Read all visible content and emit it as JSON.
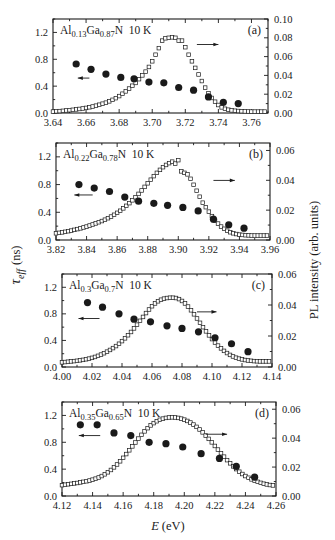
{
  "figure": {
    "y_left_label_main": "τ",
    "y_left_label_sub": "eff",
    "y_left_label_unit": "(ns)",
    "y_right_label": "PL intensity (arb. units)",
    "x_label_var": "E",
    "x_label_unit": "(eV)",
    "colors": {
      "ink": "#1a1a1a",
      "background": "#ffffff"
    }
  },
  "chart_data": [
    {
      "type": "scatter",
      "panel": "(a)",
      "title": "Al0.13Ga0.87N 10 K",
      "composition": {
        "al": "0.13",
        "ga": "0.87"
      },
      "temperature": "10 K",
      "xlabel": "E (eV)",
      "ylabel_left": "τ_eff (ns)",
      "ylabel_right": "PL intensity (arb. units)",
      "xlim": [
        3.64,
        3.77
      ],
      "ylim_left": [
        0.0,
        1.4
      ],
      "ylim_right": [
        0.0,
        0.1
      ],
      "x_ticks": [
        3.64,
        3.66,
        3.68,
        3.7,
        3.72,
        3.74,
        3.76
      ],
      "y_left_ticks": [
        0.0,
        0.4,
        0.8,
        1.2
      ],
      "y_right_ticks": [
        0.0,
        0.02,
        0.04,
        0.06,
        0.08,
        0.1
      ],
      "arrows": {
        "left": {
          "x": [
            3.655,
            3.662
          ],
          "y": 0.52
        },
        "right": {
          "x": [
            3.727,
            3.74
          ],
          "y": 1.02
        }
      },
      "series": [
        {
          "name": "tau_eff",
          "axis": "left",
          "marker": "filled-circle",
          "x": [
            3.654,
            3.663,
            3.672,
            3.681,
            3.689,
            3.698,
            3.707,
            3.716,
            3.725,
            3.734,
            3.743,
            3.752
          ],
          "y": [
            0.73,
            0.65,
            0.58,
            0.53,
            0.51,
            0.46,
            0.45,
            0.38,
            0.34,
            0.24,
            0.16,
            0.14
          ]
        },
        {
          "name": "PL intensity",
          "axis": "right",
          "marker": "open-square",
          "x": [
            3.64,
            3.642,
            3.644,
            3.646,
            3.648,
            3.65,
            3.652,
            3.654,
            3.656,
            3.658,
            3.66,
            3.662,
            3.664,
            3.666,
            3.668,
            3.67,
            3.672,
            3.674,
            3.676,
            3.678,
            3.68,
            3.682,
            3.684,
            3.686,
            3.688,
            3.69,
            3.692,
            3.694,
            3.696,
            3.698,
            3.7,
            3.702,
            3.704,
            3.706,
            3.708,
            3.71,
            3.712,
            3.714,
            3.716,
            3.718,
            3.72,
            3.722,
            3.724,
            3.726,
            3.728,
            3.73,
            3.732,
            3.734,
            3.736,
            3.738,
            3.74,
            3.742,
            3.744,
            3.746,
            3.748,
            3.75,
            3.752,
            3.754,
            3.756,
            3.758,
            3.76,
            3.762,
            3.764,
            3.766,
            3.768
          ],
          "y": [
            0.0015,
            0.0018,
            0.002,
            0.0023,
            0.0027,
            0.003,
            0.0034,
            0.0038,
            0.0043,
            0.0048,
            0.0054,
            0.0061,
            0.0069,
            0.0078,
            0.0088,
            0.0099,
            0.011,
            0.0124,
            0.014,
            0.0158,
            0.018,
            0.0205,
            0.023,
            0.026,
            0.029,
            0.032,
            0.036,
            0.04,
            0.044,
            0.049,
            0.055,
            0.062,
            0.069,
            0.077,
            0.0795,
            0.08,
            0.0805,
            0.08,
            0.077,
            0.077,
            0.07,
            0.062,
            0.055,
            0.048,
            0.041,
            0.034,
            0.027,
            0.021,
            0.016,
            0.012,
            0.0085,
            0.006,
            0.0045,
            0.0035,
            0.0028,
            0.0024,
            0.0021,
            0.0019,
            0.0017,
            0.0016,
            0.0015,
            0.0015,
            0.0015,
            0.0015,
            0.0015
          ]
        }
      ]
    },
    {
      "type": "scatter",
      "panel": "(b)",
      "title": "Al0.22Ga0.78N 10 K",
      "composition": {
        "al": "0.22",
        "ga": "0.78"
      },
      "temperature": "10 K",
      "xlabel": "E (eV)",
      "ylabel_left": "τ_eff (ns)",
      "ylabel_right": "PL intensity (arb. units)",
      "xlim": [
        3.82,
        3.96
      ],
      "ylim_left": [
        0.0,
        1.4
      ],
      "ylim_right": [
        0.0,
        0.065
      ],
      "x_ticks": [
        3.82,
        3.84,
        3.86,
        3.88,
        3.9,
        3.92,
        3.94,
        3.96
      ],
      "y_left_ticks": [
        0.0,
        0.4,
        0.8,
        1.2
      ],
      "y_right_ticks": [
        0.0,
        0.02,
        0.04,
        0.06
      ],
      "arrows": {
        "left": {
          "x": [
            3.832,
            3.844
          ],
          "y": 0.65
        },
        "right": {
          "x": [
            3.923,
            3.937
          ],
          "y": 0.86
        }
      },
      "series": [
        {
          "name": "tau_eff",
          "axis": "left",
          "marker": "filled-circle",
          "x": [
            3.835,
            3.845,
            3.855,
            3.865,
            3.874,
            3.884,
            3.893,
            3.903,
            3.913,
            3.923,
            3.933,
            3.943
          ],
          "y": [
            0.8,
            0.75,
            0.7,
            0.62,
            0.56,
            0.53,
            0.5,
            0.47,
            0.42,
            0.3,
            0.22,
            0.17
          ]
        },
        {
          "name": "PL intensity",
          "axis": "right",
          "marker": "open-square",
          "x": [
            3.82,
            3.822,
            3.824,
            3.826,
            3.828,
            3.83,
            3.832,
            3.834,
            3.836,
            3.838,
            3.84,
            3.842,
            3.844,
            3.846,
            3.848,
            3.85,
            3.852,
            3.854,
            3.856,
            3.858,
            3.86,
            3.862,
            3.864,
            3.866,
            3.868,
            3.87,
            3.872,
            3.874,
            3.876,
            3.878,
            3.88,
            3.882,
            3.884,
            3.886,
            3.888,
            3.89,
            3.892,
            3.894,
            3.896,
            3.898,
            3.9,
            3.902,
            3.904,
            3.906,
            3.908,
            3.91,
            3.912,
            3.914,
            3.916,
            3.918,
            3.92,
            3.922,
            3.924,
            3.926,
            3.928,
            3.93,
            3.932,
            3.934,
            3.936,
            3.938,
            3.94,
            3.942,
            3.944,
            3.946,
            3.948,
            3.95,
            3.952,
            3.954,
            3.956,
            3.958
          ],
          "y": [
            0.0045,
            0.0048,
            0.0051,
            0.0055,
            0.0059,
            0.0063,
            0.0068,
            0.0073,
            0.0078,
            0.0084,
            0.009,
            0.0097,
            0.0104,
            0.0111,
            0.0119,
            0.0127,
            0.0136,
            0.0146,
            0.0157,
            0.0169,
            0.0182,
            0.0196,
            0.0212,
            0.0229,
            0.0247,
            0.0266,
            0.0287,
            0.0309,
            0.0332,
            0.0356,
            0.038,
            0.0404,
            0.0428,
            0.045,
            0.047,
            0.0488,
            0.0503,
            0.0515,
            0.0525,
            0.0512,
            0.0535,
            0.046,
            0.045,
            0.044,
            0.041,
            0.037,
            0.033,
            0.029,
            0.025,
            0.022,
            0.019,
            0.016,
            0.013,
            0.011,
            0.009,
            0.0075,
            0.0062,
            0.0052,
            0.0045,
            0.004,
            0.0036,
            0.0034,
            0.0032,
            0.0031,
            0.003,
            0.003,
            0.003,
            0.003,
            0.003,
            0.003
          ]
        }
      ]
    },
    {
      "type": "scatter",
      "panel": "(c)",
      "title": "Al0.3Ga0.7N 10 K",
      "composition": {
        "al": "0.3",
        "ga": "0.7"
      },
      "temperature": "10 K",
      "xlabel": "E (eV)",
      "ylabel_left": "τ_eff (ns)",
      "ylabel_right": "PL intensity (arb. units)",
      "xlim": [
        4.0,
        4.14
      ],
      "ylim_left": [
        0.0,
        1.4
      ],
      "ylim_right": [
        0.0,
        0.06
      ],
      "x_ticks": [
        4.0,
        4.02,
        4.04,
        4.06,
        4.08,
        4.1,
        4.12,
        4.14
      ],
      "y_left_ticks": [
        0.0,
        0.4,
        0.8,
        1.2
      ],
      "y_right_ticks": [
        0.0,
        0.02,
        0.04,
        0.06
      ],
      "arrows": {
        "left": {
          "x": [
            4.011,
            4.025
          ],
          "y": 0.73
        },
        "right": {
          "x": [
            4.09,
            4.103
          ],
          "y": 0.83
        }
      },
      "series": [
        {
          "name": "tau_eff",
          "axis": "left",
          "marker": "filled-circle",
          "x": [
            4.017,
            4.027,
            4.038,
            4.048,
            4.059,
            4.07,
            4.08,
            4.091,
            4.102,
            4.113,
            4.124
          ],
          "y": [
            0.97,
            0.9,
            0.8,
            0.72,
            0.68,
            0.62,
            0.58,
            0.53,
            0.44,
            0.35,
            0.23
          ]
        },
        {
          "name": "PL intensity",
          "axis": "right",
          "marker": "open-square",
          "x": [
            4.0,
            4.002,
            4.004,
            4.006,
            4.008,
            4.01,
            4.012,
            4.014,
            4.016,
            4.018,
            4.02,
            4.022,
            4.024,
            4.026,
            4.028,
            4.03,
            4.032,
            4.034,
            4.036,
            4.038,
            4.04,
            4.042,
            4.044,
            4.046,
            4.048,
            4.05,
            4.052,
            4.054,
            4.056,
            4.058,
            4.06,
            4.062,
            4.064,
            4.066,
            4.068,
            4.07,
            4.072,
            4.074,
            4.076,
            4.078,
            4.08,
            4.082,
            4.084,
            4.086,
            4.088,
            4.09,
            4.092,
            4.094,
            4.096,
            4.098,
            4.1,
            4.102,
            4.104,
            4.106,
            4.108,
            4.11,
            4.112,
            4.114,
            4.116,
            4.118,
            4.12,
            4.122,
            4.124,
            4.126,
            4.128,
            4.13,
            4.132,
            4.134,
            4.136,
            4.138
          ],
          "y": [
            0.003,
            0.0032,
            0.0034,
            0.0036,
            0.0038,
            0.004,
            0.0043,
            0.0046,
            0.005,
            0.0054,
            0.0059,
            0.0065,
            0.0072,
            0.008,
            0.0089,
            0.0099,
            0.011,
            0.0122,
            0.0135,
            0.015,
            0.0167,
            0.0185,
            0.0205,
            0.0226,
            0.0249,
            0.0273,
            0.0298,
            0.0323,
            0.0348,
            0.0371,
            0.0392,
            0.041,
            0.0424,
            0.0434,
            0.0441,
            0.0445,
            0.0447,
            0.0447,
            0.0445,
            0.0438,
            0.0426,
            0.041,
            0.039,
            0.0366,
            0.034,
            0.0313,
            0.0285,
            0.0257,
            0.023,
            0.0204,
            0.018,
            0.0158,
            0.0138,
            0.012,
            0.0104,
            0.009,
            0.0078,
            0.0068,
            0.006,
            0.0054,
            0.0049,
            0.0045,
            0.0042,
            0.004,
            0.0038,
            0.0037,
            0.0036,
            0.0036,
            0.0036,
            0.0036
          ]
        }
      ]
    },
    {
      "type": "scatter",
      "panel": "(d)",
      "title": "Al0.35Ga0.65N 10 K",
      "composition": {
        "al": "0.35",
        "ga": "0.65"
      },
      "temperature": "10 K",
      "xlabel": "E (eV)",
      "ylabel_left": "τ_eff (ns)",
      "ylabel_right": "PL intensity (arb. units)",
      "xlim": [
        4.12,
        4.26
      ],
      "ylim_left": [
        0.0,
        1.4
      ],
      "ylim_right": [
        0.0,
        0.065
      ],
      "x_ticks": [
        4.12,
        4.14,
        4.16,
        4.18,
        4.2,
        4.22,
        4.24,
        4.26
      ],
      "y_left_ticks": [
        0.0,
        0.4,
        0.8,
        1.2
      ],
      "y_right_ticks": [
        0.0,
        0.02,
        0.04,
        0.06
      ],
      "arrows": {
        "left": {
          "x": [
            4.131,
            4.145
          ],
          "y": 0.9
        },
        "right": {
          "x": [
            4.214,
            4.228
          ],
          "y": 0.92
        }
      },
      "series": [
        {
          "name": "tau_eff",
          "axis": "left",
          "marker": "filled-circle",
          "x": [
            4.132,
            4.143,
            4.154,
            4.165,
            4.177,
            4.188,
            4.199,
            4.211,
            4.223,
            4.234,
            4.246
          ],
          "y": [
            1.06,
            1.06,
            0.94,
            0.9,
            0.8,
            0.78,
            0.73,
            0.63,
            0.56,
            0.44,
            0.28
          ]
        },
        {
          "name": "PL intensity",
          "axis": "right",
          "marker": "open-square",
          "x": [
            4.12,
            4.122,
            4.124,
            4.126,
            4.128,
            4.13,
            4.132,
            4.134,
            4.136,
            4.138,
            4.14,
            4.142,
            4.144,
            4.146,
            4.148,
            4.15,
            4.152,
            4.154,
            4.156,
            4.158,
            4.16,
            4.162,
            4.164,
            4.166,
            4.168,
            4.17,
            4.172,
            4.174,
            4.176,
            4.178,
            4.18,
            4.182,
            4.184,
            4.186,
            4.188,
            4.19,
            4.192,
            4.194,
            4.196,
            4.198,
            4.2,
            4.202,
            4.204,
            4.206,
            4.208,
            4.21,
            4.212,
            4.214,
            4.216,
            4.218,
            4.22,
            4.222,
            4.224,
            4.226,
            4.228,
            4.23,
            4.232,
            4.234,
            4.236,
            4.238,
            4.24,
            4.242,
            4.244,
            4.246,
            4.248,
            4.25,
            4.252,
            4.254,
            4.256,
            4.258
          ],
          "y": [
            0.0075,
            0.0078,
            0.0081,
            0.0084,
            0.0087,
            0.009,
            0.0094,
            0.0098,
            0.0102,
            0.0107,
            0.0113,
            0.012,
            0.0128,
            0.0138,
            0.015,
            0.0164,
            0.018,
            0.0198,
            0.0218,
            0.024,
            0.0264,
            0.029,
            0.0316,
            0.0343,
            0.037,
            0.0397,
            0.0423,
            0.0447,
            0.0469,
            0.0488,
            0.0504,
            0.0517,
            0.0527,
            0.0535,
            0.054,
            0.0543,
            0.0544,
            0.0543,
            0.054,
            0.0535,
            0.0528,
            0.0519,
            0.0508,
            0.0494,
            0.0478,
            0.046,
            0.044,
            0.0418,
            0.0395,
            0.0371,
            0.0346,
            0.0321,
            0.0296,
            0.0272,
            0.0248,
            0.0226,
            0.0205,
            0.0186,
            0.0168,
            0.0152,
            0.0138,
            0.0126,
            0.0115,
            0.0106,
            0.0098,
            0.0091,
            0.0085,
            0.008,
            0.0076,
            0.0073
          ]
        }
      ]
    }
  ],
  "layout": {
    "frames": [
      {
        "x0": 53,
        "x1": 268,
        "y0": 19,
        "y1": 113
      },
      {
        "x0": 56,
        "x1": 270,
        "y0": 143,
        "y1": 240
      },
      {
        "x0": 62,
        "x1": 272,
        "y0": 274,
        "y1": 367
      },
      {
        "x0": 62,
        "x1": 276,
        "y0": 402,
        "y1": 496
      }
    ]
  }
}
